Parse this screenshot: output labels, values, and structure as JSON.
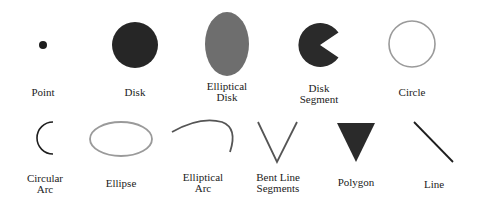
{
  "figure": {
    "rows": [
      {
        "items": [
          {
            "id": "point",
            "label": "Point"
          },
          {
            "id": "disk",
            "label": "Disk"
          },
          {
            "id": "elliptical-disk",
            "label": "Elliptical\nDisk"
          },
          {
            "id": "disk-segment",
            "label": "Disk\nSegment"
          },
          {
            "id": "circle",
            "label": "Circle"
          }
        ]
      },
      {
        "items": [
          {
            "id": "circular-arc",
            "label": "Circular\nArc"
          },
          {
            "id": "ellipse",
            "label": "Ellipse"
          },
          {
            "id": "elliptical-arc",
            "label": "Elliptical\nArc"
          },
          {
            "id": "bent-line-segments",
            "label": "Bent Line\nSegments"
          },
          {
            "id": "polygon",
            "label": "Polygon"
          },
          {
            "id": "line",
            "label": "Line"
          }
        ]
      }
    ],
    "colors": {
      "dark_fill": "#2a2a2a",
      "gray_fill": "#6e6e6e",
      "light_stroke": "#9a9a9a",
      "dark_stroke": "#1e1e1e",
      "mid_stroke": "#555555"
    }
  }
}
